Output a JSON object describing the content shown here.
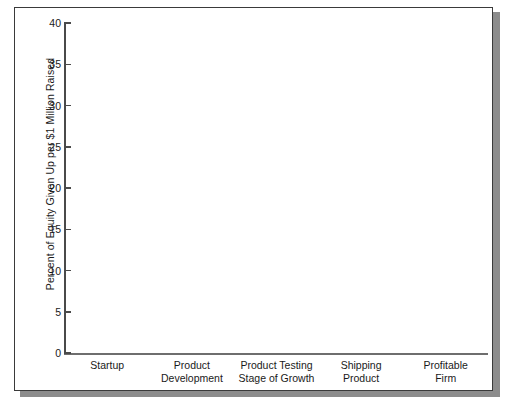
{
  "chart_data": {
    "type": "bar",
    "title": "",
    "subtitle": "",
    "xlabel": "",
    "ylabel": "Percent of Equity Given Up per $1 Million Raised",
    "categories": [
      "Startup",
      "Product Development",
      "Product Testing Stage of Growth",
      "Shipping Product",
      "Profitable Firm"
    ],
    "category_lines": [
      [
        "Startup"
      ],
      [
        "Product",
        "Development"
      ],
      [
        "Product Testing",
        "Stage of Growth"
      ],
      [
        "Shipping",
        "Product"
      ],
      [
        "Profitable",
        "Firm"
      ]
    ],
    "values": [
      34.97,
      13.53,
      8.73,
      10.57,
      5.63
    ],
    "value_labels": [
      "34.97%",
      "13.53%",
      "8.73%",
      "10.57%",
      "5.63%"
    ],
    "ylim": [
      0,
      40
    ],
    "ytick_values": [
      0,
      5,
      10,
      15,
      20,
      25,
      30,
      35,
      40
    ],
    "ytick_labels": [
      "0",
      "5",
      "10",
      "15",
      "20",
      "25",
      "30",
      "35",
      "40"
    ],
    "grid": false,
    "legend": null,
    "colors": {
      "bar_face": "#d2d2d2",
      "bar_outline": "#3a3a3a",
      "bar_shadow": "#2b2b2b",
      "axis": "#4a4a4a",
      "text": "#1a1a1a",
      "frame_border": "#3a3a3a",
      "frame_drop_shadow": "#8c8c8c",
      "background": "#ffffff"
    }
  }
}
